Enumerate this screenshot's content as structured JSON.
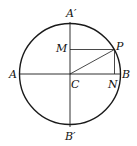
{
  "diagram": {
    "type": "geometry",
    "labels": {
      "A_prime": "A′",
      "B_prime": "B′",
      "A": "A",
      "B": "B",
      "C": "C",
      "M": "M",
      "N": "N",
      "P": "P"
    },
    "colors": {
      "stroke": "#1a1a1a",
      "background": "#ffffff"
    }
  }
}
